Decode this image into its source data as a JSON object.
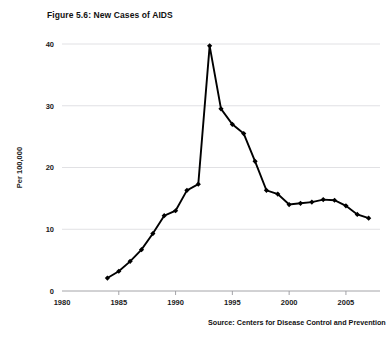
{
  "figure": {
    "title": "Figure 5.6: New Cases of AIDS",
    "source": "Source: Centers for Disease Control and Prevention"
  },
  "chart_data": {
    "type": "line",
    "title": "Figure 5.6: New Cases of AIDS",
    "xlabel": "",
    "ylabel": "Per 100,000",
    "xlim": [
      1980,
      2008
    ],
    "ylim": [
      0,
      40
    ],
    "grid": true,
    "legend": false,
    "marker": "diamond",
    "line_color": "#000000",
    "xticks": [
      1980,
      1985,
      1990,
      1995,
      2000,
      2005
    ],
    "xtick_labels": [
      "1980",
      "1985",
      "1990",
      "1995",
      "2000",
      "2005"
    ],
    "yticks": [
      0,
      10,
      20,
      30,
      40
    ],
    "ytick_labels": [
      "0",
      "10",
      "20",
      "30",
      "40"
    ],
    "x": [
      1984,
      1985,
      1986,
      1987,
      1988,
      1989,
      1990,
      1991,
      1992,
      1993,
      1994,
      1995,
      1996,
      1997,
      1998,
      1999,
      2000,
      2001,
      2002,
      2003,
      2004,
      2005,
      2006,
      2007
    ],
    "values": [
      2.1,
      3.2,
      4.8,
      6.7,
      9.3,
      12.2,
      13.0,
      16.3,
      17.3,
      39.7,
      29.5,
      27.0,
      25.5,
      21.0,
      16.3,
      15.7,
      14.0,
      14.2,
      14.4,
      14.8,
      14.7,
      13.8,
      12.4,
      11.8
    ],
    "annotations": [
      "Source: Centers for Disease Control and Prevention"
    ]
  }
}
